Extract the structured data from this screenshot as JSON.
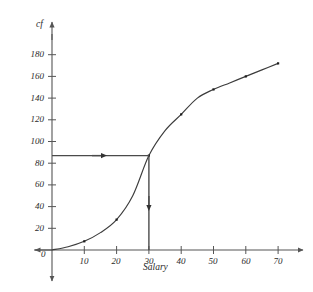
{
  "chart_data": {
    "type": "line",
    "title": "",
    "subtitle": "",
    "xlabel": "Salary",
    "ylabel": "cf",
    "xlim": [
      0,
      76
    ],
    "ylim": [
      0,
      190
    ],
    "grid": false,
    "legend": "none",
    "x_ticks": [
      10,
      20,
      30,
      40,
      50,
      60,
      70
    ],
    "x_tick_labels": [
      "10",
      "20",
      "30",
      "40",
      "50",
      "60",
      "70"
    ],
    "y_ticks": [
      20,
      40,
      60,
      80,
      100,
      120,
      140,
      160,
      180
    ],
    "y_tick_labels": [
      "20",
      "40",
      "60",
      "80",
      "100",
      "120",
      "140",
      "160",
      "180"
    ],
    "origin_label": "0",
    "series": [
      {
        "name": "cumulative frequency",
        "x": [
          0,
          5,
          10,
          15,
          20,
          25,
          30,
          35,
          40,
          45,
          50,
          55,
          60,
          65,
          70
        ],
        "values": [
          0,
          3,
          8,
          16,
          28,
          50,
          87,
          110,
          125,
          140,
          148,
          154,
          160,
          166,
          172
        ],
        "marker_x": [
          10,
          20,
          30,
          40,
          50,
          60,
          70
        ],
        "marker_values": [
          8,
          28,
          87,
          125,
          148,
          160,
          172
        ]
      }
    ],
    "annotations": [
      {
        "name": "median-read-off-horizontal",
        "type": "arrow",
        "from_x": 0,
        "from_y": 87,
        "to_x": 30,
        "to_y": 87,
        "arrow_at": "middle",
        "direction": "right"
      },
      {
        "name": "median-read-off-vertical",
        "type": "arrow",
        "from_x": 30,
        "from_y": 87,
        "to_x": 30,
        "to_y": 0,
        "arrow_at": "middle",
        "direction": "down"
      }
    ],
    "read_off": {
      "cf_value": 87,
      "salary_value": 30
    }
  },
  "style": {
    "stroke": "#3c3c3c",
    "axis_stroke": "#555555",
    "annotation_stroke": "#4a4a4a",
    "marker_fill": "#1c1c1c",
    "background": "#ffffff"
  }
}
